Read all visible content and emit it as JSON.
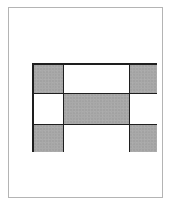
{
  "diagram": {
    "type": "grid",
    "rows": 3,
    "columns": 3,
    "cells": [
      [
        "shaded",
        "empty",
        "shaded"
      ],
      [
        "empty",
        "shaded",
        "empty"
      ],
      [
        "shaded",
        "empty",
        "shaded"
      ]
    ],
    "colors": {
      "shaded": "#a9a9a9",
      "empty": "#ffffff",
      "grid_lines": "#1e1e1e",
      "page_border": "#b4b4b4"
    }
  }
}
